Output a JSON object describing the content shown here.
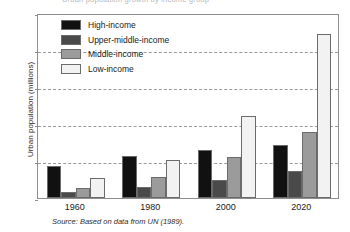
{
  "title_strip": {
    "text": "Urban population growth by income group"
  },
  "caption": {
    "source_text": "Source: Based on data from UN (1989)."
  },
  "legend": {
    "position": "inside-top-left",
    "items": [
      {
        "label": "High-income",
        "color": "#111111"
      },
      {
        "label": "Upper-middle-income",
        "color": "#4a4a4a"
      },
      {
        "label": "Middle-income",
        "color": "#9b9b9b"
      },
      {
        "label": "Low-income",
        "color": "#f2f2f2"
      }
    ]
  },
  "chart_data": {
    "type": "bar",
    "title": "",
    "xlabel": "",
    "ylabel": "Urban population (millions)",
    "categories": [
      "1960",
      "1980",
      "2000",
      "2020"
    ],
    "series": [
      {
        "name": "High-income",
        "color": "#111111",
        "values": [
          430,
          565,
          650,
          710
        ]
      },
      {
        "name": "Upper-middle-income",
        "color": "#4a4a4a",
        "values": [
          75,
          145,
          250,
          370
        ]
      },
      {
        "name": "Middle-income",
        "color": "#9b9b9b",
        "values": [
          135,
          290,
          560,
          890
        ]
      },
      {
        "name": "Low-income",
        "color": "#f2f2f2",
        "values": [
          275,
          520,
          1110,
          2220
        ]
      }
    ],
    "ylim": [
      0,
      2500
    ],
    "yticks": [
      0,
      500,
      1000,
      1500,
      2000,
      2500
    ],
    "ytick_labels": [
      "0",
      "500",
      "1000",
      "1500",
      "2000",
      "2500"
    ],
    "grid": true,
    "grid_axis": "y",
    "grid_style": "dashed",
    "legend_position": "inside-top-left"
  }
}
